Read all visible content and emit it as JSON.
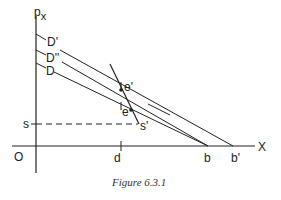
{
  "figure": {
    "caption": "Figure 6.3.1",
    "axes": {
      "y_label": "p",
      "y_label_sub": "x",
      "x_label": "X",
      "origin_label": "O"
    },
    "curve_labels": {
      "d_prime": "D'",
      "d_double_prime": "D''",
      "d": "D"
    },
    "points": {
      "e_prime": "e'",
      "e": "e",
      "s_prime": "s'",
      "s": "s"
    },
    "x_ticks": {
      "d": "d",
      "b": "b",
      "b_prime": "b'"
    },
    "colors": {
      "line": "#222222",
      "background": "#ffffff"
    }
  }
}
